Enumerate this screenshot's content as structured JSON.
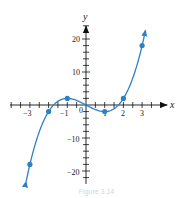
{
  "chart_data": {
    "type": "line",
    "title": "",
    "function": "y = x^3 - 3x",
    "xlabel": "x",
    "ylabel": "y",
    "xlim": [
      -3.5,
      4
    ],
    "ylim": [
      -23,
      26
    ],
    "x_ticks": [
      -4,
      -3,
      -2,
      -1,
      0,
      1,
      2,
      3,
      4
    ],
    "x_tick_labels": [
      "-3",
      "-1",
      "0",
      "1",
      "2",
      "3"
    ],
    "y_tick_labels": [
      "20",
      "10",
      "-10",
      "-20"
    ],
    "grid": false,
    "series": [
      {
        "name": "curve",
        "color": "#2e7fc4",
        "points": [
          {
            "x": -3,
            "y": -18
          },
          {
            "x": -2,
            "y": -2
          },
          {
            "x": -1,
            "y": 2
          },
          {
            "x": 1,
            "y": -2
          },
          {
            "x": 2,
            "y": 2
          },
          {
            "x": 3,
            "y": 18
          }
        ]
      }
    ]
  },
  "labels": {
    "x_axis": "x",
    "y_axis": "y",
    "origin": "0",
    "xm3": "−3",
    "xm1": "−1",
    "x1": "1",
    "x2": "2",
    "x3": "3",
    "y20": "20",
    "y10": "10",
    "ym10": "−10",
    "ym20": "−20"
  },
  "caption": "Figure 3.14"
}
